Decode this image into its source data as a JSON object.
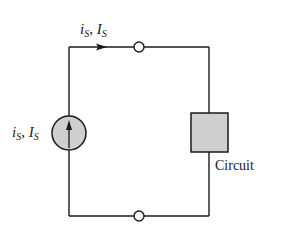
{
  "diagram": {
    "type": "circuit-schematic",
    "colors": {
      "wire": "#1a1a1a",
      "fill": "#cfcfcf",
      "terminal_fill": "#ffffff",
      "background": "#ffffff"
    },
    "top_current_label": {
      "lower_var": "i",
      "lower_sub": "S",
      "sep": ", ",
      "upper_var": "I",
      "upper_sub": "S"
    },
    "source_label": {
      "lower_var": "i",
      "lower_sub": "S",
      "sep": ", ",
      "upper_var": "I",
      "upper_sub": "S"
    },
    "source": {
      "kind": "current-source",
      "arrow": "up"
    },
    "load": {
      "label": "Circuit"
    },
    "terminals": [
      "top",
      "bottom"
    ]
  }
}
